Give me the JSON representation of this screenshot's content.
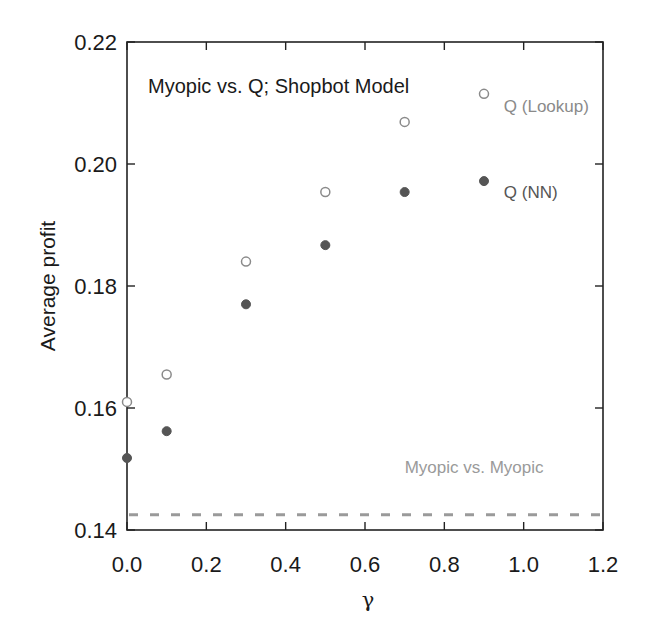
{
  "chart_data": {
    "type": "scatter",
    "title": "Myopic vs. Q; Shopbot Model",
    "xlabel": "γ",
    "ylabel": "Average profit",
    "xlim": [
      0.0,
      1.2
    ],
    "ylim": [
      0.14,
      0.22
    ],
    "x_ticks": [
      "0.0",
      "0.2",
      "0.4",
      "0.6",
      "0.8",
      "1.0",
      "1.2"
    ],
    "y_ticks": [
      "0.14",
      "0.16",
      "0.18",
      "0.20",
      "0.22"
    ],
    "grid": false,
    "series": [
      {
        "name": "Q (Lookup)",
        "marker": "open-circle",
        "color": "#8a8a8a",
        "x": [
          0.0,
          0.1,
          0.3,
          0.5,
          0.7,
          0.9
        ],
        "y": [
          0.161,
          0.1655,
          0.184,
          0.1954,
          0.2069,
          0.2115
        ]
      },
      {
        "name": "Q (NN)",
        "marker": "filled-circle",
        "color": "#555555",
        "x": [
          0.0,
          0.1,
          0.3,
          0.5,
          0.7,
          0.9
        ],
        "y": [
          0.1518,
          0.1562,
          0.177,
          0.1867,
          0.1954,
          0.1972
        ]
      },
      {
        "name": "Myopic vs. Myopic",
        "marker": "dashed-line",
        "color": "#9a9a9a",
        "x": [
          0.0,
          1.2
        ],
        "y": [
          0.1425,
          0.1425
        ]
      }
    ],
    "annotations": [
      {
        "text": "Q (Lookup)",
        "x": 0.95,
        "y": 0.2085,
        "color": "#8a8a8a"
      },
      {
        "text": "Q (NN)",
        "x": 0.95,
        "y": 0.1945,
        "color": "#555555"
      },
      {
        "text": "Myopic vs. Myopic",
        "x": 0.7,
        "y": 0.1493,
        "color": "#9a9a9a"
      }
    ]
  }
}
